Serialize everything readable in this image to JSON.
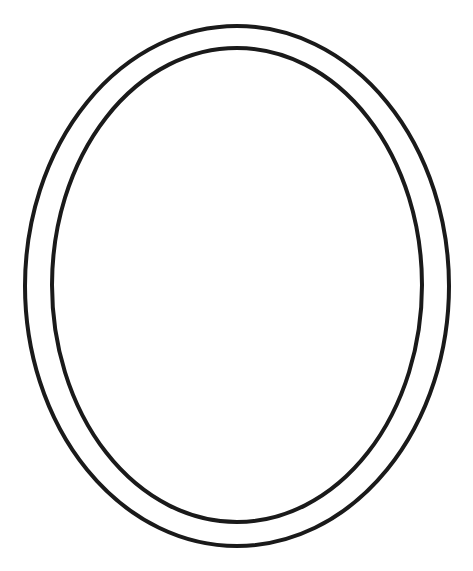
{
  "page": {
    "top_text": "",
    "background": "#ffffff"
  },
  "figure": {
    "type": "double-oval-frame-outline",
    "stroke_color": "#1a1a1a",
    "outer": {
      "cx": 237,
      "cy": 286,
      "rx": 212,
      "ry": 260,
      "stroke_width": 4
    },
    "inner": {
      "cx": 237,
      "cy": 285,
      "rx": 185,
      "ry": 237,
      "stroke_width": 4
    }
  }
}
